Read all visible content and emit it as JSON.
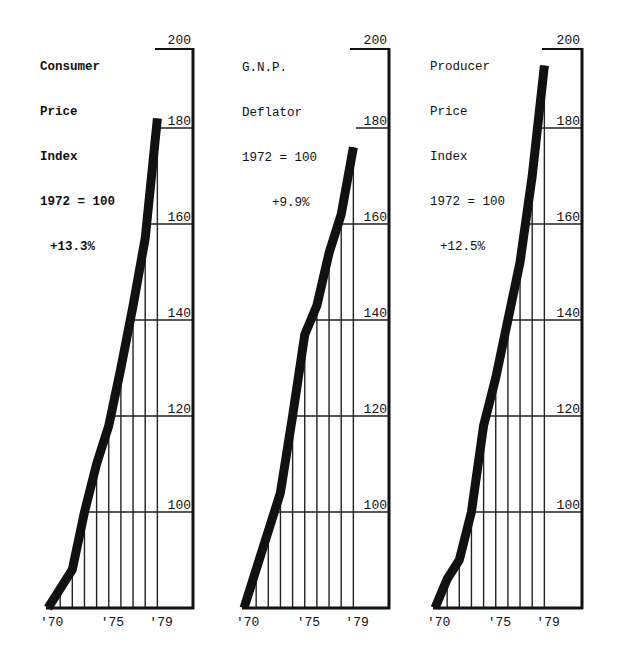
{
  "chart_data": [
    {
      "type": "line",
      "title": "Consumer Price Index",
      "subtitle": "1972 = 100",
      "annotation": "+13.3%",
      "x": [
        1970,
        1971,
        1972,
        1973,
        1974,
        1975,
        1976,
        1977,
        1978,
        1979
      ],
      "x_tick_labels": [
        "'70",
        "'75",
        "'79"
      ],
      "y_tick_labels": [
        "100",
        "120",
        "140",
        "160",
        "180",
        "200"
      ],
      "values": [
        80,
        84,
        88,
        100,
        110,
        118,
        130,
        143,
        157,
        182
      ],
      "ylim": [
        80,
        200
      ],
      "grid": true,
      "xlabel": "",
      "ylabel": ""
    },
    {
      "type": "line",
      "title": "G.N.P. Deflator",
      "subtitle": "1972 = 100",
      "annotation": "+9.9%",
      "x": [
        1970,
        1971,
        1972,
        1973,
        1974,
        1975,
        1976,
        1977,
        1978,
        1979
      ],
      "x_tick_labels": [
        "'70",
        "'75",
        "'79"
      ],
      "y_tick_labels": [
        "100",
        "120",
        "140",
        "160",
        "180",
        "200"
      ],
      "values": [
        80,
        88,
        96,
        104,
        120,
        137,
        143,
        154,
        162,
        176
      ],
      "ylim": [
        80,
        200
      ],
      "grid": true,
      "xlabel": "",
      "ylabel": ""
    },
    {
      "type": "line",
      "title": "Producer Price Index",
      "subtitle": "1972 = 100",
      "annotation": "+12.5%",
      "x": [
        1970,
        1971,
        1972,
        1973,
        1974,
        1975,
        1976,
        1977,
        1978,
        1979
      ],
      "x_tick_labels": [
        "'70",
        "'75",
        "'79"
      ],
      "y_tick_labels": [
        "100",
        "120",
        "140",
        "160",
        "180",
        "200"
      ],
      "values": [
        80,
        86,
        90,
        100,
        118,
        128,
        140,
        152,
        170,
        193
      ],
      "ylim": [
        80,
        200
      ],
      "grid": true,
      "xlabel": "",
      "ylabel": ""
    }
  ],
  "panels": [
    {
      "title_lines": [
        "Consumer",
        "Price",
        "Index",
        "1972 = 100"
      ],
      "change": "+13.3%",
      "bold": true
    },
    {
      "title_lines": [
        "G.N.P.",
        "Deflator",
        "1972 = 100"
      ],
      "change": "+9.9%",
      "bold": false
    },
    {
      "title_lines": [
        "Producer",
        "Price",
        "Index",
        "1972 = 100"
      ],
      "change": "+12.5%",
      "bold": false
    }
  ],
  "axis": {
    "y_ticks": [
      "100",
      "120",
      "140",
      "160",
      "180",
      "200"
    ],
    "x_ticks": [
      "'70",
      "'75",
      "'79"
    ]
  },
  "colors": {
    "line": "#111111",
    "background": "#ffffff"
  }
}
